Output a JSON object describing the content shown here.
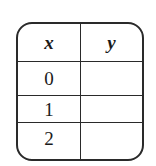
{
  "table": {
    "headers": [
      "x",
      "y"
    ],
    "rows": [
      {
        "x": "0",
        "y": ""
      },
      {
        "x": "1",
        "y": ""
      },
      {
        "x": "2",
        "y": ""
      }
    ]
  }
}
